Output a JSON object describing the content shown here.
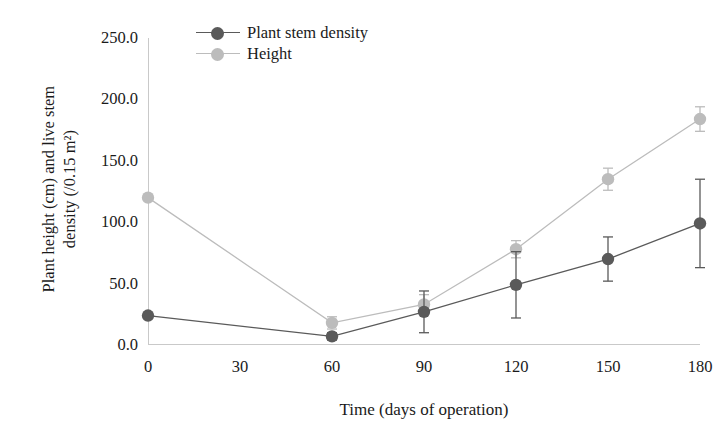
{
  "chart_data": {
    "type": "line",
    "title": "",
    "xlabel": "Time (days of operation)",
    "ylabel": "Plant height (cm) and live stem\ndensity (/0.15 m²)",
    "xlim": [
      0,
      180
    ],
    "ylim": [
      0,
      250
    ],
    "xticks": [
      "0",
      "30",
      "60",
      "90",
      "120",
      "150",
      "180"
    ],
    "xtick_values": [
      0,
      30,
      60,
      90,
      120,
      150,
      180
    ],
    "yticks": [
      "0.0",
      "50.0",
      "100.0",
      "150.0",
      "200.0",
      "250.0"
    ],
    "ytick_values": [
      0,
      50,
      100,
      150,
      200,
      250
    ],
    "grid": false,
    "legend_position": "top-left-inside",
    "x": [
      0,
      60,
      90,
      120,
      150,
      180
    ],
    "series": [
      {
        "name": "Plant stem density",
        "color": "#5a5a5a",
        "marker": "circle",
        "values": [
          24,
          7,
          27,
          49,
          70,
          99
        ],
        "errors": [
          0,
          3,
          17,
          27,
          18,
          36
        ]
      },
      {
        "name": "Height",
        "color": "#bcbcbc",
        "marker": "circle",
        "values": [
          120,
          18,
          33,
          78,
          135,
          184
        ],
        "errors": [
          0,
          5,
          8,
          7,
          9,
          10
        ]
      }
    ]
  },
  "legend": {
    "items": [
      {
        "label": "Plant stem density"
      },
      {
        "label": "Height"
      }
    ]
  },
  "axes": {
    "x_title": "Time (days of operation)",
    "y_title": "Plant height (cm) and live stem\ndensity (/0.15 m²)"
  },
  "colors": {
    "series_dark": "#5a5a5a",
    "series_light": "#bcbcbc",
    "axis": "#c9c9c9",
    "text": "#1a1a1a",
    "background": "#ffffff"
  }
}
